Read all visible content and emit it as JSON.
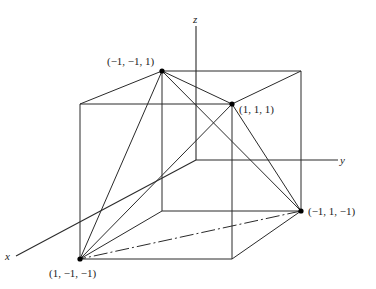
{
  "figure": {
    "axes": {
      "x_label": "x",
      "y_label": "y",
      "z_label": "z"
    },
    "vertices": [
      {
        "id": "v1",
        "label": "(−1, −1, 1)"
      },
      {
        "id": "v2",
        "label": "(1, 1, 1)"
      },
      {
        "id": "v3",
        "label": "(−1, 1, −1)"
      },
      {
        "id": "v4",
        "label": "(1, −1, −1)"
      }
    ]
  }
}
